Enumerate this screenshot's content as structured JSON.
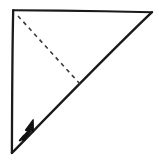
{
  "figure": {
    "title": "Paper folding step diagram",
    "background_color": "#ffffff",
    "ink_color": "#1a1a1a",
    "canvas": {
      "width": 159,
      "height": 165
    }
  },
  "shape": {
    "name": "right-triangle-paper",
    "vertices": {
      "top_left": {
        "x": 13,
        "y": 10
      },
      "top_right": {
        "x": 152,
        "y": 12
      },
      "bottom_left": {
        "x": 12,
        "y": 153
      }
    },
    "edges": [
      {
        "name": "top-edge",
        "from": "top_left",
        "to": "top_right",
        "style": "solid"
      },
      {
        "name": "left-edge",
        "from": "top_left",
        "to": "bottom_left",
        "style": "solid"
      },
      {
        "name": "hypotenuse-edge",
        "from": "bottom_left",
        "to": "top_right",
        "style": "solid"
      }
    ],
    "stroke_width": 2.1,
    "fill": "#ffffff"
  },
  "fold_line": {
    "name": "dashed-fold-line",
    "style": "dashed",
    "from": {
      "x": 18,
      "y": 16
    },
    "to": {
      "x": 80,
      "y": 84
    },
    "dash_pattern": "4 4",
    "stroke_width": 1.6,
    "color": "#3a3a3a"
  },
  "fold_arrow": {
    "name": "fold-direction-arrow",
    "direction": "up-right",
    "tail": {
      "x": 21,
      "y": 139
    },
    "tip": {
      "x": 33,
      "y": 120
    },
    "color": "#111111"
  },
  "caption": {
    "text": "",
    "visible": false
  }
}
